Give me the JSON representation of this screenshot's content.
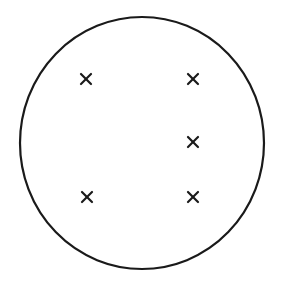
{
  "diagram": {
    "type": "circle-with-cross-marks",
    "background": "#ffffff",
    "stroke_color": "#1a1a1a",
    "circle": {
      "cx": 142,
      "cy": 143,
      "rx": 122,
      "ry": 126,
      "stroke_width": 2.2
    },
    "marks": [
      {
        "id": "top-left",
        "x": 86,
        "y": 79
      },
      {
        "id": "top-right",
        "x": 193,
        "y": 79
      },
      {
        "id": "middle-right",
        "x": 193,
        "y": 142
      },
      {
        "id": "bottom-left",
        "x": 87,
        "y": 197
      },
      {
        "id": "bottom-right",
        "x": 193,
        "y": 197
      }
    ],
    "mark_size": 5,
    "mark_stroke_width": 2.2,
    "mark_count": 5
  }
}
